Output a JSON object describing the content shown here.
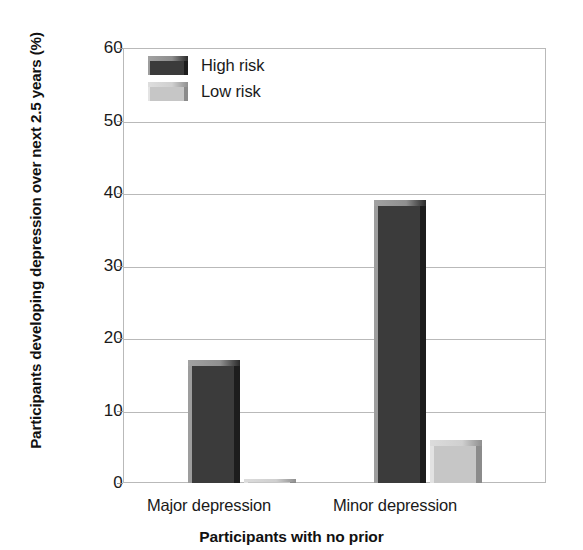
{
  "chart_data": {
    "type": "bar",
    "title": "",
    "subtitle": "",
    "xlabel": "Participants with no prior",
    "ylabel": "Participants developing depression over next 2.5 years (%)",
    "categories": [
      "Major depression",
      "Minor depression"
    ],
    "series": [
      {
        "name": "High risk",
        "color": "#3b3b3b",
        "values": [
          17,
          39
        ]
      },
      {
        "name": "Low risk",
        "color": "#c6c6c6",
        "values": [
          0.5,
          6
        ]
      }
    ],
    "ylim": [
      0,
      60
    ],
    "yticks": [
      0,
      10,
      20,
      30,
      40,
      50,
      60
    ],
    "ytick_labels": [
      "0",
      "10",
      "20",
      "30",
      "40",
      "50",
      "60"
    ],
    "grid": "horizontal",
    "legend_position": "top-left-inside",
    "legend_entries": [
      "High risk",
      "Low risk"
    ],
    "annotations": []
  },
  "axes": {
    "y_title": "Participants developing depression over next 2.5 years (%)",
    "x_title": "Participants with no prior",
    "y_ticks": [
      "0",
      "10",
      "20",
      "30",
      "40",
      "50",
      "60"
    ],
    "x_ticks": [
      "Major depression",
      "Minor depression"
    ]
  },
  "legend": {
    "items": [
      {
        "label": "High risk",
        "swatch": "dark-swatch"
      },
      {
        "label": "Low risk",
        "swatch": "light-swatch"
      }
    ]
  },
  "colors": {
    "high_risk": "#3b3b3b",
    "low_risk": "#c6c6c6",
    "gridline": "#b9b9b9",
    "text": "#1a1a1a",
    "background": "#ffffff"
  }
}
